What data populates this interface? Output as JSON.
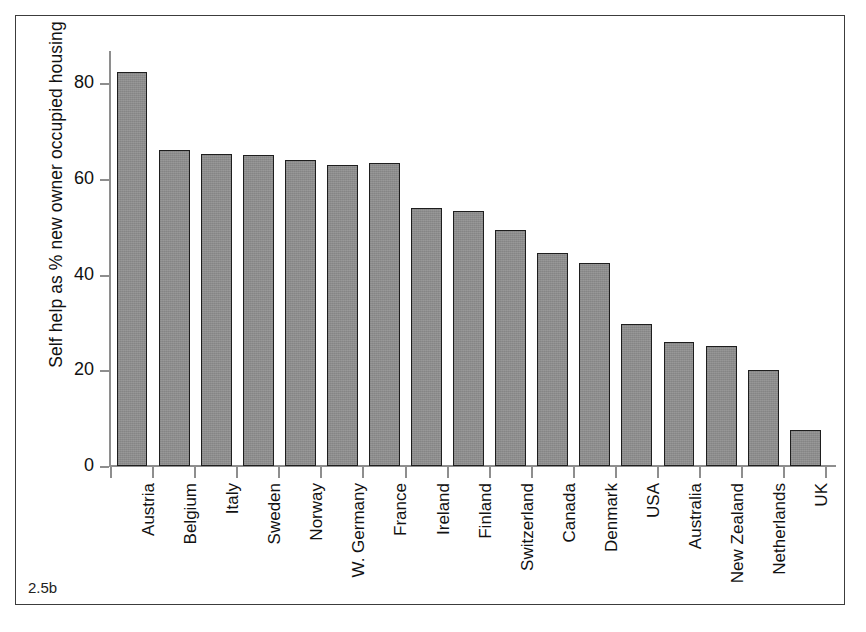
{
  "figure": {
    "caption": "2.5b"
  },
  "chart_data": {
    "type": "bar",
    "title": "",
    "xlabel": "",
    "ylabel": "Self help as % new owner occupied housing",
    "ylim": [
      0,
      87
    ],
    "yticks": [
      0,
      20,
      40,
      60,
      80
    ],
    "ytick_labels": [
      "0",
      "20",
      "40",
      "60",
      "80"
    ],
    "grid": false,
    "legend": null,
    "bar_color": "#8c8c8c",
    "bar_edge_color": "#1e1e1e",
    "categories": [
      "Austria",
      "Belgium",
      "Italy",
      "Sweden",
      "Norway",
      "W. Germany",
      "France",
      "Ireland",
      "Finland",
      "Switzerland",
      "Canada",
      "Denmark",
      "USA",
      "Australia",
      "New Zealand",
      "Netherlands",
      "UK"
    ],
    "values": [
      82.3,
      66.0,
      65.3,
      65.0,
      64.0,
      63.0,
      63.3,
      54.0,
      53.3,
      49.3,
      44.5,
      42.5,
      29.7,
      26.0,
      25.0,
      20.0,
      7.6
    ]
  }
}
